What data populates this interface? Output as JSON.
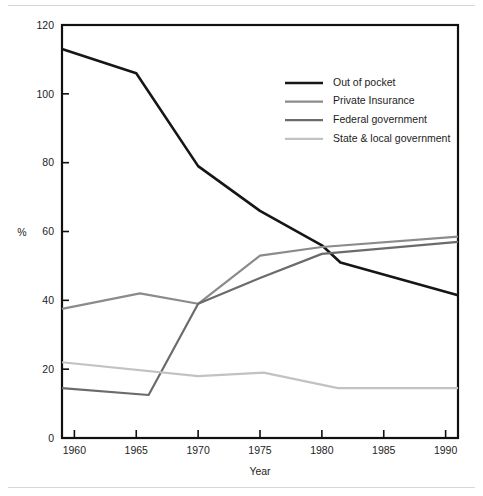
{
  "figure": {
    "background_color": "#ffffff",
    "rule_color": "#d8d8d8"
  },
  "chart_data": {
    "type": "line",
    "title": "",
    "subtitle": "",
    "xlabel": "Year",
    "ylabel": "%",
    "xlim": [
      1959,
      1991
    ],
    "ylim": [
      0,
      120
    ],
    "xticks": [
      1960,
      1965,
      1970,
      1975,
      1980,
      1985,
      1990
    ],
    "xtick_labels": [
      "1960",
      "1965",
      "1970",
      "1975",
      "1980",
      "1985",
      "1990"
    ],
    "yticks": [
      0,
      20,
      40,
      60,
      80,
      100,
      120
    ],
    "ytick_labels": [
      "0",
      "20",
      "40",
      "60",
      "80",
      "100",
      "120"
    ],
    "grid": false,
    "legend_position": "upper right",
    "series": [
      {
        "name": "Out of pocket",
        "color": "#161616",
        "width": 2.6,
        "x": [
          1959,
          1965,
          1970,
          1975,
          1980,
          1981.5,
          1991
        ],
        "values": [
          113,
          106,
          79,
          66,
          56,
          51,
          41.5
        ]
      },
      {
        "name": "Private Insurance",
        "color": "#8b8b8b",
        "width": 2.2,
        "x": [
          1959,
          1965.3,
          1970,
          1975,
          1980,
          1991
        ],
        "values": [
          37.5,
          42,
          39,
          53,
          55.5,
          58.5
        ]
      },
      {
        "name": "Federal government",
        "color": "#6b6b6b",
        "width": 2.2,
        "x": [
          1959,
          1966,
          1970,
          1975,
          1980,
          1991
        ],
        "values": [
          14.5,
          12.5,
          39,
          46.5,
          53.5,
          57
        ]
      },
      {
        "name": "State & local government",
        "color": "#c2c2c2",
        "width": 2.2,
        "x": [
          1959,
          1970,
          1975.3,
          1981.3,
          1991
        ],
        "values": [
          22,
          18,
          19,
          14.5,
          14.5
        ]
      }
    ]
  },
  "legend": {
    "items": [
      {
        "label": "Out of pocket"
      },
      {
        "label": "Private Insurance"
      },
      {
        "label": "Federal government"
      },
      {
        "label": "State & local government"
      }
    ]
  }
}
